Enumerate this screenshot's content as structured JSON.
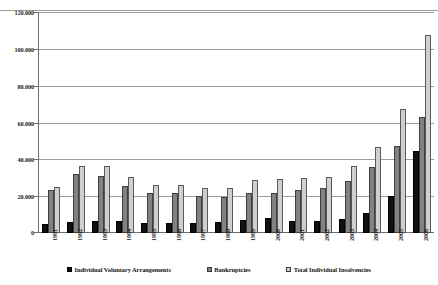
{
  "chart_data": {
    "type": "bar",
    "title": "",
    "xlabel": "",
    "ylabel": "",
    "ylim": [
      0,
      120000
    ],
    "grid": true,
    "legend_position": "bottom",
    "thousands_separator": ".",
    "ytick_labels": [
      "120.000",
      "100.000",
      "80.000",
      "60.000",
      "40.000",
      "20.000",
      "0"
    ],
    "ytick_values": [
      120000,
      100000,
      80000,
      60000,
      40000,
      20000,
      0
    ],
    "categories": [
      "1991",
      "1992",
      "1993",
      "1994",
      "1995",
      "1996",
      "1997",
      "1998",
      "1999",
      "2000",
      "2001",
      "2002",
      "2003",
      "2004",
      "2005",
      "2006"
    ],
    "series": [
      {
        "name": "Individual Voluntary Arrangements",
        "color": "#101010",
        "values": [
          4900,
          6000,
          6700,
          6500,
          5700,
          5500,
          5600,
          6000,
          7200,
          7900,
          6300,
          6300,
          7600,
          10800,
          20300,
          44300
        ]
      },
      {
        "name": "Bankruptcies",
        "color": "#828282",
        "values": [
          23300,
          32100,
          31000,
          25600,
          21900,
          21800,
          19900,
          19600,
          21600,
          21600,
          23500,
          24300,
          28000,
          35900,
          47300,
          62900
        ]
      },
      {
        "name": "Total Individual Insolvencies",
        "color": "#cfcfcf",
        "values": [
          25200,
          36200,
          36300,
          30600,
          26100,
          26300,
          24400,
          24500,
          28800,
          29500,
          29800,
          30600,
          36300,
          46700,
          67600,
          107300
        ]
      }
    ]
  }
}
